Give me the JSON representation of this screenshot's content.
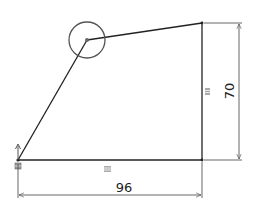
{
  "sketch": {
    "colors": {
      "geometry": "#222222",
      "dimension": "#555555",
      "circle": "#555555",
      "relation_icon": "#777777",
      "background": "#ffffff"
    },
    "vertices": {
      "origin": [
        18,
        160
      ],
      "bottom_right": [
        202,
        160
      ],
      "top_right": [
        202,
        23
      ],
      "apex": [
        87,
        40
      ]
    },
    "circle": {
      "center": [
        87,
        40
      ],
      "radius": 18
    },
    "dimensions": {
      "width": {
        "value": "96",
        "line_y": 195,
        "text_x": 124,
        "text_y": 192
      },
      "height": {
        "value": "70",
        "line_x": 239,
        "text_x": 232,
        "text_y": 91
      }
    },
    "relations": [
      {
        "type": "horizontal",
        "icon": "equal-icon",
        "x": 107,
        "y": 169
      },
      {
        "type": "vertical",
        "icon": "equal-icon",
        "x": 207,
        "y": 91
      },
      {
        "type": "fixed",
        "icon": "fixed-origin-icon",
        "x": 18,
        "y": 166
      }
    ]
  }
}
